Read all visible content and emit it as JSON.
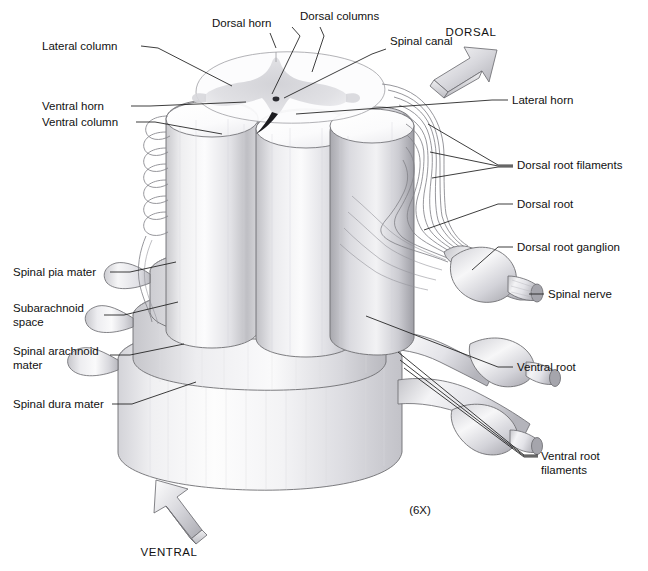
{
  "figure": {
    "scale_label": "(6X)",
    "background_color": "#ffffff",
    "line_color": "#1b1b1b"
  },
  "orientation": {
    "dorsal": {
      "label": "DORSAL",
      "direction": "up-right",
      "icon": "block-arrow-icon"
    },
    "ventral": {
      "label": "VENTRAL",
      "direction": "down-left",
      "icon": "block-arrow-icon"
    }
  },
  "labels": {
    "lateral_column": "Lateral column",
    "ventral_horn": "Ventral horn",
    "ventral_column": "Ventral column",
    "dorsal_horn": "Dorsal horn",
    "dorsal_columns": "Dorsal columns",
    "spinal_canal": "Spinal canal",
    "lateral_horn": "Lateral horn",
    "dorsal_root_filaments": "Dorsal root filaments",
    "dorsal_root": "Dorsal root",
    "dorsal_root_ganglion": "Dorsal root ganglion",
    "spinal_nerve": "Spinal nerve",
    "ventral_root": "Ventral root",
    "ventral_root_filaments_line1": "Ventral root",
    "ventral_root_filaments_line2": "filaments",
    "spinal_pia_mater": "Spinal pia mater",
    "subarachnoid_space_line1": "Subarachnoid",
    "subarachnoid_space_line2": "space",
    "spinal_arachnoid_mater_line1": "Spinal arachnoid",
    "spinal_arachnoid_mater_line2": "mater",
    "spinal_dura_mater": "Spinal dura mater"
  },
  "structures": [
    {
      "name": "spinal-cord-cross-section",
      "description": "Butterfly-shaped gray matter with central canal"
    },
    {
      "name": "white-matter-columns",
      "description": "Three cylindrical funiculi columns"
    },
    {
      "name": "pia-mater-sheath",
      "description": "Innermost membrane hugging the cord"
    },
    {
      "name": "arachnoid-mater-sheath",
      "description": "Middle membrane layer"
    },
    {
      "name": "dura-mater-sheath",
      "description": "Outermost tough cylindrical sheath"
    },
    {
      "name": "dorsal-root-ganglion",
      "description": "Bulbous swelling on the dorsal root"
    },
    {
      "name": "spinal-nerve-trunk",
      "description": "Mixed nerve distal to the ganglion"
    }
  ]
}
